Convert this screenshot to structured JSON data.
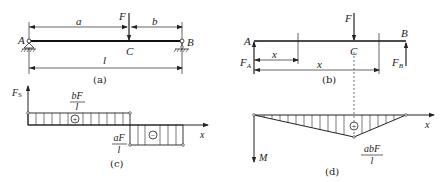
{
  "figure_a": {
    "caption": "(a)",
    "labels": {
      "A": "A",
      "B": "B",
      "C": "C",
      "F": "F",
      "a": "a",
      "b": "b",
      "l": "l"
    }
  },
  "figure_b": {
    "caption": "(b)",
    "labels": {
      "A": "A",
      "B": "B",
      "C": "C",
      "F": "F",
      "FA": "F",
      "FA_sub": "A",
      "FB": "F",
      "FB_sub": "B",
      "x1": "x",
      "x2": "x"
    }
  },
  "figure_c": {
    "caption": "(c)",
    "axis_y": "F",
    "axis_y_sub": "S",
    "axis_x": "x",
    "positive": {
      "num": "bF",
      "den": "l",
      "sign": "+"
    },
    "negative": {
      "num": "aF",
      "den": "l",
      "sign": "−"
    }
  },
  "figure_d": {
    "caption": "(d)",
    "axis_y": "M",
    "axis_x": "x",
    "peak": {
      "num": "abF",
      "den": "l",
      "sign": "+"
    }
  }
}
